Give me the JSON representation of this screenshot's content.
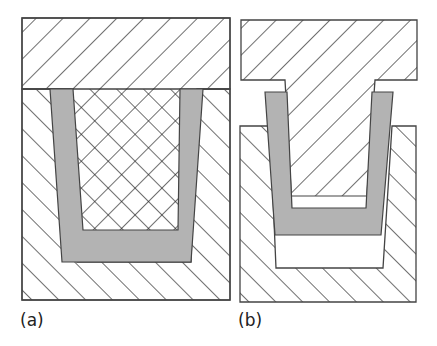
{
  "figure": {
    "panels": [
      {
        "id": "a",
        "label": "(a)",
        "description": "Mold closed: punch fully inserted into die, part (gray U) fills the cavity"
      },
      {
        "id": "b",
        "label": "(b)",
        "description": "Mold opened: punch raised, part (gray U) lifted partway from die cavity"
      }
    ],
    "colors": {
      "part_fill": "#b3b3b3",
      "outline": "#444444",
      "hatch": "#222222",
      "background": "#ffffff"
    }
  }
}
